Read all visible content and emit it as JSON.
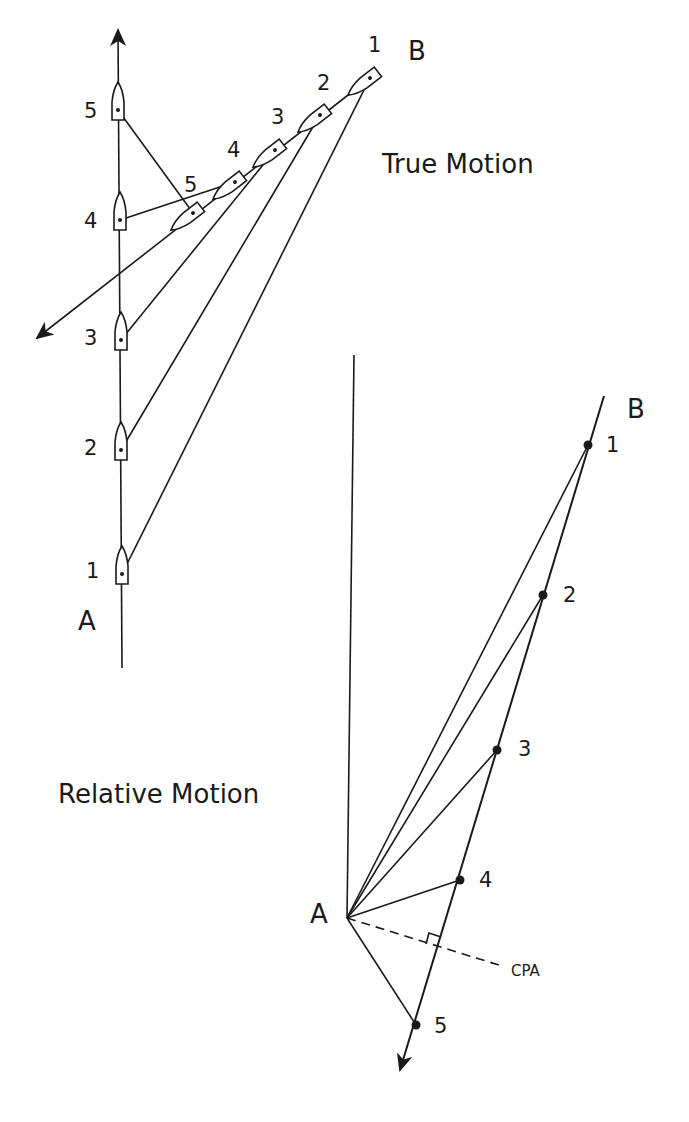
{
  "true_motion": {
    "title": "True Motion",
    "own_ship_label": "A",
    "target_label": "B",
    "own_positions": [
      {
        "label": "5",
        "x": 118,
        "y": 110
      },
      {
        "label": "4",
        "x": 120,
        "y": 220
      },
      {
        "label": "3",
        "x": 121,
        "y": 340
      },
      {
        "label": "2",
        "x": 121,
        "y": 450
      },
      {
        "label": "1",
        "x": 122,
        "y": 574
      }
    ],
    "target_positions": [
      {
        "label": "1",
        "x": 370,
        "y": 78
      },
      {
        "label": "2",
        "x": 320,
        "y": 115
      },
      {
        "label": "3",
        "x": 275,
        "y": 150
      },
      {
        "label": "4",
        "x": 235,
        "y": 182
      },
      {
        "label": "5",
        "x": 193,
        "y": 213
      }
    ]
  },
  "relative_motion": {
    "title": "Relative Motion",
    "own_ship_label": "A",
    "target_label": "B",
    "cpa_label": "CPA",
    "points": [
      {
        "label": "1",
        "x": 588,
        "y": 445
      },
      {
        "label": "2",
        "x": 543,
        "y": 595
      },
      {
        "label": "3",
        "x": 497,
        "y": 750
      },
      {
        "label": "4",
        "x": 460,
        "y": 880
      },
      {
        "label": "5",
        "x": 416,
        "y": 1025
      }
    ]
  },
  "colors": {
    "ink": "#1a1a1a",
    "background": "#ffffff"
  }
}
